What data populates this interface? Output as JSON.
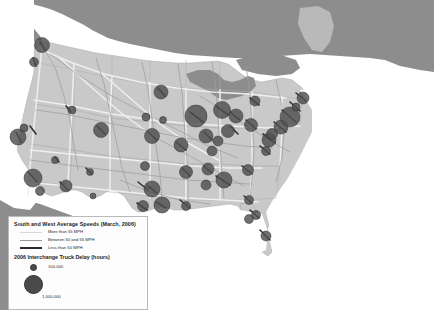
{
  "map": {
    "name": "us-highway-speed-and-truck-delay-map",
    "colors": {
      "background": "#ffffff",
      "us_land": "#c9c9c9",
      "canada_mexico_land": "#8d8d8d",
      "water": "#ffffff",
      "state_border": "#b0b0b0",
      "highway_fast": "#efefef",
      "highway_mid": "#9d9d9d",
      "highway_slow": "#303030",
      "delay_circle": "#4f4f4f",
      "delay_circle_edge": "#2e2e2e"
    }
  },
  "legend": {
    "speed_title": "South and West Average Speeds (March, 2006)",
    "speed_classes": [
      {
        "label": "More than 55 MPH",
        "swatch": "line-light"
      },
      {
        "label": "Between 50 and 55 MPH",
        "swatch": "line-medium"
      },
      {
        "label": "Less than 50 MPH",
        "swatch": "line-dark-thick"
      }
    ],
    "delay_title": "2006 Interchange Truck Delay (hours)",
    "delay_symbols": [
      {
        "label": "100,000",
        "size": "small"
      },
      {
        "label": "1,000,000",
        "size": "large"
      }
    ]
  },
  "chart_data": {
    "type": "map",
    "region": "Contiguous United States",
    "symbol_variable": "Interchange truck delay (hours)",
    "symbol_scale": [
      {
        "value": 100000,
        "radius_px": 2.5
      },
      {
        "value": 1000000,
        "radius_px": 8.5
      }
    ],
    "line_variable": "Average truck speed (MPH)",
    "line_classes": [
      "More than 55 MPH",
      "Between 50 and 55 MPH",
      "Less than 50 MPH"
    ],
    "delay_points": [
      {
        "city": "Seattle",
        "x": 42,
        "y": 45,
        "r": 7.5
      },
      {
        "city": "Portland",
        "x": 34,
        "y": 62,
        "r": 4.5
      },
      {
        "city": "San Francisco",
        "x": 18,
        "y": 137,
        "r": 8.0
      },
      {
        "city": "Sacramento",
        "x": 24,
        "y": 128,
        "r": 4.0
      },
      {
        "city": "Los Angeles",
        "x": 33,
        "y": 178,
        "r": 9.0
      },
      {
        "city": "San Diego",
        "x": 40,
        "y": 191,
        "r": 4.5
      },
      {
        "city": "Las Vegas",
        "x": 55,
        "y": 160,
        "r": 3.5
      },
      {
        "city": "Phoenix",
        "x": 66,
        "y": 186,
        "r": 6.0
      },
      {
        "city": "Salt Lake City",
        "x": 72,
        "y": 110,
        "r": 4.0
      },
      {
        "city": "Denver",
        "x": 101,
        "y": 130,
        "r": 7.5
      },
      {
        "city": "Albuquerque",
        "x": 90,
        "y": 172,
        "r": 3.5
      },
      {
        "city": "El Paso",
        "x": 93,
        "y": 196,
        "r": 3.0
      },
      {
        "city": "Kansas City",
        "x": 152,
        "y": 136,
        "r": 7.5
      },
      {
        "city": "Omaha",
        "x": 146,
        "y": 117,
        "r": 4.0
      },
      {
        "city": "Oklahoma City",
        "x": 145,
        "y": 166,
        "r": 4.5
      },
      {
        "city": "Dallas",
        "x": 152,
        "y": 189,
        "r": 8.0
      },
      {
        "city": "San Antonio",
        "x": 143,
        "y": 206,
        "r": 5.5
      },
      {
        "city": "Houston",
        "x": 162,
        "y": 205,
        "r": 8.0
      },
      {
        "city": "Minneapolis",
        "x": 161,
        "y": 92,
        "r": 7.0
      },
      {
        "city": "Des Moines",
        "x": 163,
        "y": 120,
        "r": 3.5
      },
      {
        "city": "St. Louis",
        "x": 181,
        "y": 145,
        "r": 7.0
      },
      {
        "city": "Memphis",
        "x": 186,
        "y": 172,
        "r": 6.5
      },
      {
        "city": "New Orleans",
        "x": 186,
        "y": 206,
        "r": 4.5
      },
      {
        "city": "Chicago",
        "x": 196,
        "y": 116,
        "r": 11.0
      },
      {
        "city": "Indianapolis",
        "x": 206,
        "y": 136,
        "r": 7.0
      },
      {
        "city": "Louisville",
        "x": 212,
        "y": 151,
        "r": 5.0
      },
      {
        "city": "Nashville",
        "x": 208,
        "y": 169,
        "r": 6.0
      },
      {
        "city": "Birmingham",
        "x": 206,
        "y": 185,
        "r": 5.0
      },
      {
        "city": "Atlanta",
        "x": 224,
        "y": 180,
        "r": 8.0
      },
      {
        "city": "Detroit",
        "x": 222,
        "y": 110,
        "r": 8.5
      },
      {
        "city": "Columbus",
        "x": 228,
        "y": 131,
        "r": 6.5
      },
      {
        "city": "Cincinnati",
        "x": 218,
        "y": 141,
        "r": 5.0
      },
      {
        "city": "Cleveland",
        "x": 236,
        "y": 116,
        "r": 7.0
      },
      {
        "city": "Pittsburgh",
        "x": 251,
        "y": 125,
        "r": 6.5
      },
      {
        "city": "Buffalo",
        "x": 255,
        "y": 101,
        "r": 5.0
      },
      {
        "city": "Charlotte",
        "x": 248,
        "y": 170,
        "r": 5.5
      },
      {
        "city": "Richmond",
        "x": 266,
        "y": 151,
        "r": 4.5
      },
      {
        "city": "Washington DC",
        "x": 269,
        "y": 140,
        "r": 7.0
      },
      {
        "city": "Baltimore",
        "x": 272,
        "y": 134,
        "r": 5.5
      },
      {
        "city": "Philadelphia",
        "x": 281,
        "y": 127,
        "r": 7.0
      },
      {
        "city": "New York",
        "x": 290,
        "y": 117,
        "r": 10.0
      },
      {
        "city": "Hartford",
        "x": 296,
        "y": 107,
        "r": 4.0
      },
      {
        "city": "Boston",
        "x": 303,
        "y": 98,
        "r": 6.0
      },
      {
        "city": "Jacksonville",
        "x": 249,
        "y": 200,
        "r": 4.5
      },
      {
        "city": "Orlando",
        "x": 256,
        "y": 215,
        "r": 4.5
      },
      {
        "city": "Tampa",
        "x": 249,
        "y": 219,
        "r": 4.5
      },
      {
        "city": "Miami",
        "x": 266,
        "y": 236,
        "r": 5.0
      }
    ]
  }
}
